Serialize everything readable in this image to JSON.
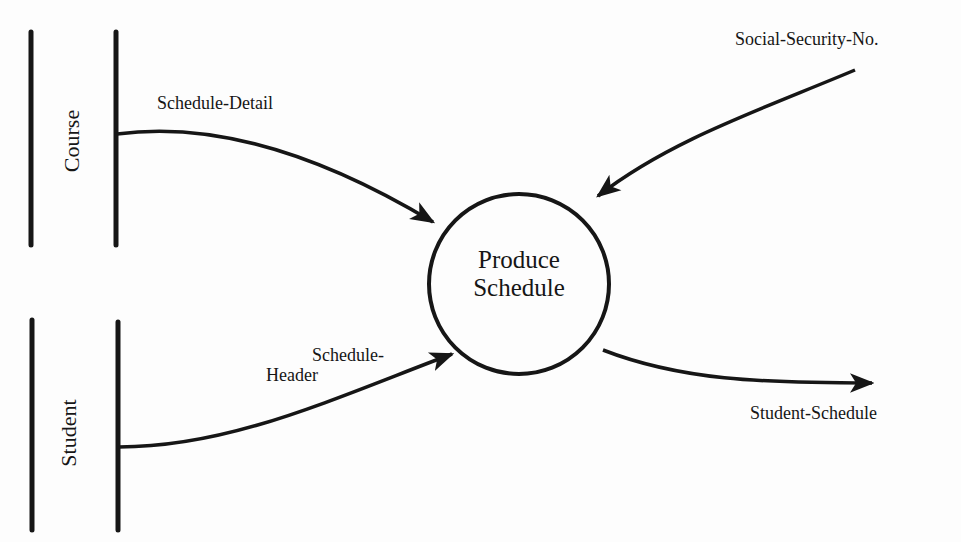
{
  "diagram": {
    "type": "data-flow-diagram",
    "process": {
      "label_line1": "Produce",
      "label_line2": "Schedule"
    },
    "data_stores": [
      {
        "label": "Course"
      },
      {
        "label": "Student"
      }
    ],
    "flows": [
      {
        "label": "Schedule-Detail",
        "from": "Course",
        "to": "Produce Schedule"
      },
      {
        "label_line1": "Schedule-",
        "label_line2": "Header",
        "from": "Student",
        "to": "Produce Schedule"
      },
      {
        "label": "Social-Security-No.",
        "from": "external",
        "to": "Produce Schedule"
      },
      {
        "label": "Student-Schedule",
        "from": "Produce Schedule",
        "to": "external"
      }
    ],
    "colors": {
      "ink": "#161616",
      "paper": "#fdfdfd"
    }
  }
}
